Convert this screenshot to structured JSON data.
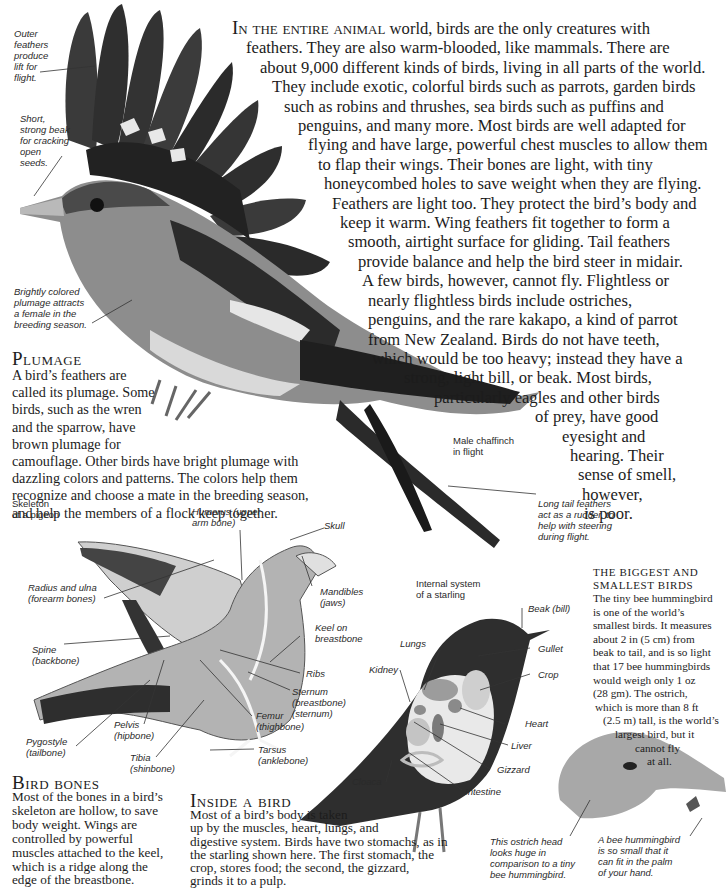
{
  "intro": {
    "lead_caps": "In the entire animal",
    "lines": [
      " world, birds are the only creatures with",
      "feathers. They are also warm-blooded, like mammals. There are",
      "about 9,000 different kinds of birds, living in all parts of the world.",
      "They include exotic, colorful birds such as parrots, garden birds",
      "such as robins and thrushes, sea birds such as puffins and",
      "penguins, and many more. Most birds are well adapted for",
      "flying and have large, powerful chest muscles to allow them",
      "to flap their wings. Their bones are light, with tiny",
      "honeycombed holes to save weight when they are flying.",
      "Feathers are light too. They protect the bird’s body and",
      "keep it warm. Wing feathers fit together to form a",
      "smooth, airtight surface for gliding. Tail feathers",
      "provide balance and help the bird steer in midair.",
      "A few birds, however, cannot fly. Flightless or",
      "nearly flightless birds include ostriches,",
      "penguins, and the rare kakapo, a kind of parrot",
      "from New Zealand. Birds do not have teeth,",
      "which would be too heavy; instead they have a",
      "strong, light bill, or beak. Most birds,",
      "particularly eagles and other birds",
      "of prey, have good",
      "eyesight and",
      "hearing. Their",
      "sense of smell,",
      "however,",
      "is poor."
    ]
  },
  "chaffinch": {
    "caption": [
      "Male chaffinch",
      "in flight"
    ],
    "labels": {
      "outer_feathers": [
        "Outer",
        "feathers",
        "produce",
        "lift for",
        "flight."
      ],
      "beak": [
        "Short,",
        "strong beak",
        "for cracking",
        "open",
        "seeds."
      ],
      "plumage": [
        "Brightly colored",
        "plumage attracts",
        "a female in the",
        "breeding season."
      ],
      "tail": [
        "Long tail feathers",
        "act as a rudder, to",
        "help with steering",
        "during flight."
      ]
    }
  },
  "plumage": {
    "heading": "Plumage",
    "lines": [
      "A bird’s feathers are",
      "called its plumage. Some",
      "birds, such as the wren",
      "and the sparrow, have",
      "brown plumage for",
      "camouflage. Other birds have bright plumage with",
      "dazzling colors and patterns. The colors help them",
      "recognize and choose a mate in the breeding season,",
      "and help the members of a flock keep together."
    ]
  },
  "pigeon": {
    "caption": [
      "Skeleton",
      "of a pigeon"
    ],
    "labels": {
      "humerus": [
        "Humerus (upper",
        "arm bone)"
      ],
      "skull": [
        "Skull"
      ],
      "radius": [
        "Radius and ulna",
        "(forearm bones)"
      ],
      "mandibles": [
        "Mandibles",
        "(jaws)"
      ],
      "keel": [
        "Keel on",
        "breastbone"
      ],
      "spine": [
        "Spine",
        "(backbone)"
      ],
      "ribs": [
        "Ribs"
      ],
      "sternum": [
        "Sternum",
        "(breastbone)",
        "(sternum)"
      ],
      "femur": [
        "Femur",
        "(thighbone)"
      ],
      "pelvis": [
        "Pelvis",
        "(hipbone)"
      ],
      "pygostyle": [
        "Pygostyle",
        "(tailbone)"
      ],
      "tibia": [
        "Tibia",
        "(shinbone)"
      ],
      "tarsus": [
        "Tarsus",
        "(anklebone)"
      ]
    }
  },
  "bird_bones": {
    "heading": "Bird bones",
    "lines": [
      "Most of the bones in a bird’s",
      "skeleton are hollow, to save",
      "body weight. Wings are",
      "controlled by powerful",
      "muscles attached to the keel,",
      "which is a ridge along the",
      "edge of the breastbone."
    ]
  },
  "starling": {
    "caption": [
      "Internal system",
      "of a starling"
    ],
    "labels": {
      "beak": [
        "Beak (bill)"
      ],
      "lungs": [
        "Lungs"
      ],
      "gullet": [
        "Gullet"
      ],
      "kidney": [
        "Kidney"
      ],
      "crop": [
        "Crop"
      ],
      "heart": [
        "Heart"
      ],
      "liver": [
        "Liver"
      ],
      "gizzard": [
        "Gizzard"
      ],
      "cloaca": [
        "Cloaca"
      ],
      "intestine": [
        "Intestine"
      ]
    }
  },
  "inside_a_bird": {
    "heading": "Inside a bird",
    "lines": [
      "Most of a bird’s body is taken",
      "up by the muscles, heart, lungs, and",
      "digestive system. Birds have two stomachs, as in",
      "the starling shown here. The first stomach, the",
      "crop, stores food; the second, the gizzard,",
      "grinds it to a pulp."
    ]
  },
  "biggest_smallest": {
    "heading_lines": [
      "The biggest and",
      "smallest birds"
    ],
    "lines": [
      "The tiny bee hummingbird",
      "is one of the world’s",
      "smallest birds. It measures",
      "about 2 in (5 cm) from",
      "beak to tail,  and is so light",
      "that 17 bee hummingbirds",
      "would weigh only 1 oz",
      "(28 gm). The ostrich,",
      "which is more than 8 ft",
      "(2.5 m) tall, is the world’s",
      "largest bird, but it",
      "cannot fly",
      "at all."
    ]
  },
  "ostrich": {
    "labels": {
      "head": [
        "This ostrich head",
        "looks huge in",
        "comparison to a tiny",
        "bee hummingbird."
      ],
      "hummingbird": [
        "A bee hummingbird",
        "is so small that it",
        "can fit in the palm",
        "of your hand."
      ]
    }
  }
}
